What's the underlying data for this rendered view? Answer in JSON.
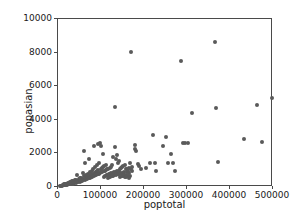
{
  "chart_data": {
    "type": "scatter",
    "title": "",
    "xlabel": "poptotal",
    "ylabel": "popasian",
    "xlim": [
      0,
      500000
    ],
    "ylim": [
      0,
      10000
    ],
    "xticks": [
      0,
      100000,
      200000,
      300000,
      400000,
      500000
    ],
    "yticks": [
      0,
      2000,
      4000,
      6000,
      8000,
      10000
    ],
    "xtick_labels": [
      "0",
      "100000",
      "200000",
      "300000",
      "400000",
      "500000"
    ],
    "ytick_labels": [
      "0",
      "2000",
      "4000",
      "6000",
      "8000",
      "10000"
    ],
    "grid": false,
    "legend": null,
    "marker_color": "#5a5a5a",
    "marker_size": 4,
    "axes_color": "#4a4a4a",
    "background": "#ffffff",
    "points": [
      [
        5000,
        60
      ],
      [
        7000,
        80
      ],
      [
        9000,
        70
      ],
      [
        11000,
        110
      ],
      [
        12000,
        90
      ],
      [
        13000,
        130
      ],
      [
        14000,
        100
      ],
      [
        15000,
        150
      ],
      [
        16000,
        120
      ],
      [
        17000,
        160
      ],
      [
        18000,
        140
      ],
      [
        19000,
        180
      ],
      [
        20000,
        130
      ],
      [
        21000,
        200
      ],
      [
        22000,
        170
      ],
      [
        23000,
        210
      ],
      [
        24000,
        150
      ],
      [
        25000,
        230
      ],
      [
        26000,
        190
      ],
      [
        27000,
        250
      ],
      [
        28000,
        170
      ],
      [
        29000,
        270
      ],
      [
        30000,
        220
      ],
      [
        31000,
        300
      ],
      [
        32000,
        180
      ],
      [
        33000,
        330
      ],
      [
        34000,
        250
      ],
      [
        35000,
        200
      ],
      [
        36000,
        360
      ],
      [
        37000,
        280
      ],
      [
        38000,
        230
      ],
      [
        39000,
        390
      ],
      [
        40000,
        300
      ],
      [
        41000,
        250
      ],
      [
        42000,
        420
      ],
      [
        43000,
        320
      ],
      [
        44000,
        270
      ],
      [
        45000,
        700
      ],
      [
        46000,
        350
      ],
      [
        47000,
        290
      ],
      [
        48000,
        480
      ],
      [
        49000,
        380
      ],
      [
        50000,
        310
      ],
      [
        51000,
        520
      ],
      [
        52000,
        400
      ],
      [
        53000,
        340
      ],
      [
        54000,
        560
      ],
      [
        55000,
        430
      ],
      [
        56000,
        370
      ],
      [
        57000,
        820
      ],
      [
        58000,
        460
      ],
      [
        59000,
        390
      ],
      [
        60000,
        640
      ],
      [
        61000,
        2150
      ],
      [
        62000,
        420
      ],
      [
        63000,
        1420
      ],
      [
        64000,
        520
      ],
      [
        65000,
        450
      ],
      [
        66000,
        730
      ],
      [
        67000,
        560
      ],
      [
        68000,
        480
      ],
      [
        69000,
        790
      ],
      [
        70000,
        600
      ],
      [
        71000,
        510
      ],
      [
        72000,
        1680
      ],
      [
        73000,
        640
      ],
      [
        74000,
        540
      ],
      [
        75000,
        880
      ],
      [
        76000,
        690
      ],
      [
        77000,
        580
      ],
      [
        78000,
        950
      ],
      [
        79000,
        740
      ],
      [
        80000,
        610
      ],
      [
        81000,
        1050
      ],
      [
        82000,
        790
      ],
      [
        83000,
        650
      ],
      [
        84000,
        2420
      ],
      [
        85000,
        840
      ],
      [
        86000,
        690
      ],
      [
        87000,
        1180
      ],
      [
        88000,
        890
      ],
      [
        89000,
        720
      ],
      [
        90000,
        1280
      ],
      [
        91000,
        940
      ],
      [
        92000,
        760
      ],
      [
        93000,
        2560
      ],
      [
        94000,
        990
      ],
      [
        95000,
        800
      ],
      [
        96000,
        1420
      ],
      [
        97000,
        2600
      ],
      [
        98000,
        830
      ],
      [
        99000,
        1050
      ],
      [
        100000,
        2450
      ],
      [
        101000,
        870
      ],
      [
        102000,
        1120
      ],
      [
        103000,
        900
      ],
      [
        104000,
        1980
      ],
      [
        105000,
        1190
      ],
      [
        106000,
        930
      ],
      [
        107000,
        620
      ],
      [
        108000,
        1260
      ],
      [
        109000,
        960
      ],
      [
        110000,
        680
      ],
      [
        111000,
        1330
      ],
      [
        112000,
        990
      ],
      [
        113000,
        710
      ],
      [
        114000,
        1050
      ],
      [
        115000,
        740
      ],
      [
        116000,
        560
      ],
      [
        117000,
        1100
      ],
      [
        118000,
        770
      ],
      [
        119000,
        590
      ],
      [
        120000,
        1160
      ],
      [
        121000,
        800
      ],
      [
        122000,
        620
      ],
      [
        123000,
        1220
      ],
      [
        124000,
        830
      ],
      [
        125000,
        650
      ],
      [
        126000,
        1290
      ],
      [
        127000,
        860
      ],
      [
        128000,
        680
      ],
      [
        129000,
        1790
      ],
      [
        130000,
        890
      ],
      [
        131000,
        710
      ],
      [
        132000,
        4780
      ],
      [
        133000,
        2380
      ],
      [
        134000,
        920
      ],
      [
        135000,
        1640
      ],
      [
        136000,
        740
      ],
      [
        137000,
        1900
      ],
      [
        138000,
        950
      ],
      [
        139000,
        1450
      ],
      [
        140000,
        770
      ],
      [
        141000,
        1540
      ],
      [
        142000,
        980
      ],
      [
        143000,
        800
      ],
      [
        144000,
        1050
      ],
      [
        145000,
        620
      ],
      [
        146000,
        1120
      ],
      [
        147000,
        830
      ],
      [
        148000,
        650
      ],
      [
        149000,
        1180
      ],
      [
        150000,
        860
      ],
      [
        151000,
        680
      ],
      [
        152000,
        1240
      ],
      [
        153000,
        890
      ],
      [
        154000,
        710
      ],
      [
        155000,
        1300
      ],
      [
        156000,
        600
      ],
      [
        157000,
        740
      ],
      [
        158000,
        1050
      ],
      [
        159000,
        620
      ],
      [
        160000,
        920
      ],
      [
        161000,
        1100
      ],
      [
        162000,
        650
      ],
      [
        163000,
        980
      ],
      [
        164000,
        560
      ],
      [
        165000,
        1150
      ],
      [
        166000,
        830
      ],
      [
        167000,
        680
      ],
      [
        168000,
        1420
      ],
      [
        169000,
        1050
      ],
      [
        170000,
        8010
      ],
      [
        171000,
        1200
      ],
      [
        172000,
        950
      ],
      [
        178000,
        2490
      ],
      [
        180000,
        2270
      ],
      [
        182000,
        2150
      ],
      [
        185000,
        1350
      ],
      [
        188000,
        1270
      ],
      [
        192000,
        1050
      ],
      [
        205000,
        1130
      ],
      [
        215000,
        1450
      ],
      [
        222000,
        3120
      ],
      [
        225000,
        1400
      ],
      [
        228000,
        960
      ],
      [
        245000,
        2430
      ],
      [
        252000,
        2950
      ],
      [
        256000,
        1400
      ],
      [
        262000,
        1980
      ],
      [
        268000,
        1430
      ],
      [
        272000,
        960
      ],
      [
        285000,
        7520
      ],
      [
        290000,
        2600
      ],
      [
        296000,
        2610
      ],
      [
        302000,
        2620
      ],
      [
        312000,
        4430
      ],
      [
        365000,
        8610
      ],
      [
        368000,
        4700
      ],
      [
        372000,
        1470
      ],
      [
        432000,
        2840
      ],
      [
        462000,
        4890
      ],
      [
        475000,
        2700
      ],
      [
        498000,
        5280
      ]
    ]
  }
}
